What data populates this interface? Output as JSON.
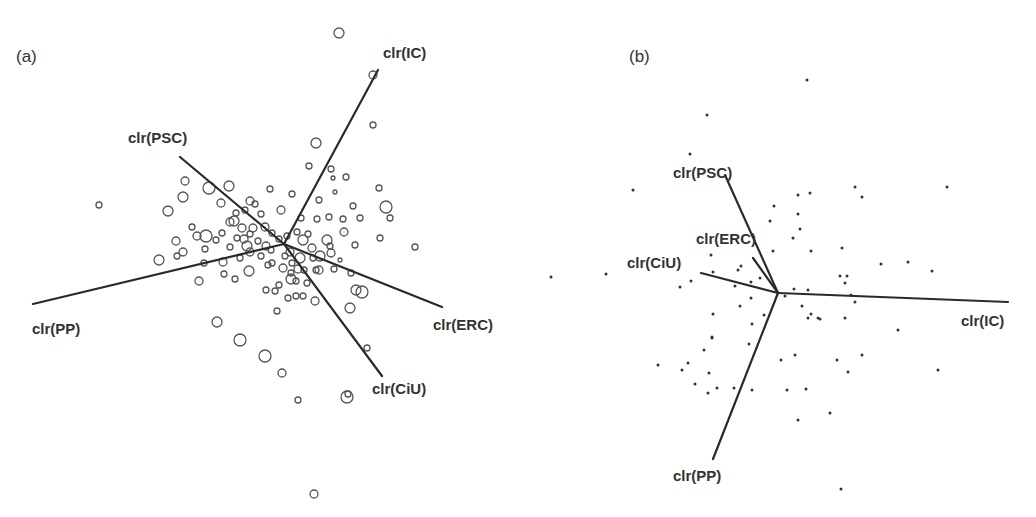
{
  "chart_data": [
    {
      "type": "scatter",
      "title": "(a)",
      "subtype": "compositional biplot",
      "center": [
        284,
        244
      ],
      "marker": "open-circle",
      "rays": [
        {
          "label": "clr(IC)",
          "end": [
            378,
            70
          ],
          "label_pos": [
            383,
            58
          ]
        },
        {
          "label": "clr(PSC)",
          "end": [
            180,
            157
          ],
          "label_pos": [
            128,
            143
          ]
        },
        {
          "label": "clr(PP)",
          "end": [
            33,
            304
          ],
          "label_pos": [
            32,
            334
          ]
        },
        {
          "label": "clr(ERC)",
          "end": [
            442,
            307
          ],
          "label_pos": [
            433,
            330
          ]
        },
        {
          "label": "clr(CiU)",
          "end": [
            382,
            376
          ],
          "label_pos": [
            372,
            394
          ]
        }
      ],
      "points": [
        [
          339,
          33,
          5
        ],
        [
          373,
          75,
          4
        ],
        [
          373,
          125,
          3
        ],
        [
          316,
          143,
          5
        ],
        [
          309,
          166,
          3
        ],
        [
          331,
          169,
          3
        ],
        [
          333,
          178,
          2
        ],
        [
          346,
          177,
          3
        ],
        [
          99,
          205,
          3
        ],
        [
          185,
          181,
          4
        ],
        [
          209,
          188,
          6
        ],
        [
          229,
          186,
          5
        ],
        [
          183,
          197,
          5
        ],
        [
          168,
          211,
          5
        ],
        [
          221,
          203,
          4
        ],
        [
          250,
          201,
          4
        ],
        [
          270,
          189,
          3
        ],
        [
          292,
          194,
          3
        ],
        [
          319,
          200,
          3
        ],
        [
          335,
          192,
          2
        ],
        [
          353,
          206,
          3
        ],
        [
          379,
          188,
          3
        ],
        [
          386,
          207,
          6
        ],
        [
          390,
          218,
          3
        ],
        [
          245,
          210,
          3
        ],
        [
          234,
          221,
          5
        ],
        [
          242,
          228,
          4
        ],
        [
          261,
          214,
          3
        ],
        [
          265,
          227,
          4
        ],
        [
          281,
          210,
          4
        ],
        [
          301,
          218,
          3
        ],
        [
          297,
          232,
          3
        ],
        [
          303,
          240,
          5
        ],
        [
          317,
          219,
          3
        ],
        [
          329,
          217,
          3
        ],
        [
          343,
          219,
          3
        ],
        [
          360,
          218,
          3
        ],
        [
          344,
          232,
          4
        ],
        [
          327,
          240,
          5
        ],
        [
          320,
          256,
          5
        ],
        [
          176,
          241,
          4
        ],
        [
          197,
          236,
          4
        ],
        [
          206,
          236,
          6
        ],
        [
          192,
          227,
          3
        ],
        [
          222,
          233,
          3
        ],
        [
          230,
          222,
          4
        ],
        [
          250,
          234,
          3
        ],
        [
          272,
          233,
          3
        ],
        [
          266,
          246,
          4
        ],
        [
          247,
          246,
          5
        ],
        [
          253,
          228,
          4
        ],
        [
          237,
          238,
          3
        ],
        [
          230,
          247,
          3
        ],
        [
          216,
          240,
          3
        ],
        [
          205,
          249,
          3
        ],
        [
          183,
          252,
          4
        ],
        [
          159,
          260,
          5
        ],
        [
          177,
          256,
          3
        ],
        [
          204,
          263,
          3
        ],
        [
          223,
          262,
          4
        ],
        [
          240,
          258,
          3
        ],
        [
          261,
          256,
          3
        ],
        [
          272,
          263,
          3
        ],
        [
          290,
          252,
          4
        ],
        [
          300,
          258,
          5
        ],
        [
          312,
          248,
          4
        ],
        [
          313,
          258,
          3
        ],
        [
          331,
          253,
          4
        ],
        [
          334,
          269,
          3
        ],
        [
          355,
          245,
          3
        ],
        [
          380,
          238,
          3
        ],
        [
          415,
          247,
          3
        ],
        [
          199,
          281,
          4
        ],
        [
          224,
          274,
          3
        ],
        [
          235,
          279,
          3
        ],
        [
          249,
          271,
          5
        ],
        [
          268,
          265,
          3
        ],
        [
          283,
          268,
          4
        ],
        [
          291,
          273,
          3
        ],
        [
          296,
          281,
          3
        ],
        [
          291,
          279,
          5
        ],
        [
          304,
          270,
          3
        ],
        [
          316,
          270,
          3
        ],
        [
          340,
          260,
          2
        ],
        [
          351,
          273,
          3
        ],
        [
          356,
          290,
          5
        ],
        [
          362,
          292,
          6
        ],
        [
          350,
          308,
          5
        ],
        [
          275,
          291,
          3
        ],
        [
          288,
          298,
          3
        ],
        [
          296,
          296,
          3
        ],
        [
          303,
          296,
          3
        ],
        [
          315,
          301,
          4
        ],
        [
          277,
          311,
          3
        ],
        [
          217,
          322,
          5
        ],
        [
          240,
          340,
          6
        ],
        [
          265,
          356,
          6
        ],
        [
          282,
          373,
          4
        ],
        [
          298,
          400,
          3
        ],
        [
          347,
          397,
          6
        ],
        [
          348,
          394,
          3
        ],
        [
          367,
          348,
          3
        ],
        [
          314,
          494,
          4
        ],
        [
          298,
          269,
          4
        ],
        [
          255,
          204,
          3
        ],
        [
          236,
          213,
          3
        ],
        [
          258,
          241,
          3
        ],
        [
          279,
          239,
          3
        ],
        [
          287,
          236,
          3
        ],
        [
          308,
          234,
          3
        ],
        [
          271,
          250,
          3
        ],
        [
          250,
          252,
          4
        ],
        [
          285,
          256,
          3
        ],
        [
          292,
          263,
          3
        ],
        [
          319,
          270,
          4
        ],
        [
          307,
          283,
          3
        ],
        [
          279,
          285,
          3
        ],
        [
          266,
          290,
          3
        ],
        [
          244,
          239,
          4
        ],
        [
          330,
          246,
          3
        ]
      ]
    },
    {
      "type": "scatter",
      "title": "(b)",
      "subtype": "compositional biplot",
      "center": [
        778,
        293
      ],
      "marker": "filled-dot",
      "rays": [
        {
          "label": "clr(PSC)",
          "end": [
            725,
            175
          ],
          "label_pos": [
            673,
            178
          ]
        },
        {
          "label": "clr(ERC)",
          "end": [
            753,
            258
          ],
          "label_pos": [
            696,
            244
          ]
        },
        {
          "label": "clr(CiU)",
          "end": [
            701,
            273
          ],
          "label_pos": [
            627,
            268
          ]
        },
        {
          "label": "clr(IC)",
          "end": [
            1008,
            302
          ],
          "label_pos": [
            961,
            326
          ]
        },
        {
          "label": "clr(PP)",
          "end": [
            713,
            459
          ],
          "label_pos": [
            673,
            481
          ]
        }
      ],
      "points": [
        [
          807,
          80
        ],
        [
          707,
          115
        ],
        [
          690,
          154
        ],
        [
          633,
          190
        ],
        [
          798,
          195
        ],
        [
          810,
          193
        ],
        [
          774,
          206
        ],
        [
          798,
          214
        ],
        [
          855,
          187
        ],
        [
          862,
          197
        ],
        [
          947,
          187
        ],
        [
          770,
          221
        ],
        [
          793,
          238
        ],
        [
          800,
          229
        ],
        [
          773,
          251
        ],
        [
          811,
          251
        ],
        [
          842,
          248
        ],
        [
          847,
          276
        ],
        [
          908,
          262
        ],
        [
          881,
          264
        ],
        [
          932,
          271
        ],
        [
          711,
          255
        ],
        [
          741,
          266
        ],
        [
          713,
          272
        ],
        [
          738,
          270
        ],
        [
          691,
          281
        ],
        [
          680,
          287
        ],
        [
          735,
          286
        ],
        [
          751,
          282
        ],
        [
          760,
          278
        ],
        [
          785,
          296
        ],
        [
          794,
          289
        ],
        [
          808,
          290
        ],
        [
          840,
          276
        ],
        [
          845,
          283
        ],
        [
          851,
          295
        ],
        [
          855,
          302
        ],
        [
          551,
          277
        ],
        [
          606,
          274
        ],
        [
          713,
          314
        ],
        [
          751,
          298
        ],
        [
          740,
          306
        ],
        [
          802,
          306
        ],
        [
          818,
          318
        ],
        [
          808,
          318
        ],
        [
          811,
          314
        ],
        [
          845,
          318
        ],
        [
          898,
          330
        ],
        [
          712,
          337
        ],
        [
          752,
          324
        ],
        [
          712,
          338
        ],
        [
          749,
          344
        ],
        [
          704,
          350
        ],
        [
          688,
          363
        ],
        [
          658,
          365
        ],
        [
          682,
          370
        ],
        [
          709,
          373
        ],
        [
          717,
          388
        ],
        [
          695,
          384
        ],
        [
          734,
          388
        ],
        [
          708,
          393
        ],
        [
          752,
          390
        ],
        [
          781,
          360
        ],
        [
          795,
          355
        ],
        [
          837,
          360
        ],
        [
          862,
          355
        ],
        [
          848,
          372
        ],
        [
          938,
          370
        ],
        [
          787,
          390
        ],
        [
          806,
          389
        ],
        [
          798,
          420
        ],
        [
          830,
          413
        ],
        [
          841,
          489
        ],
        [
          764,
          315
        ],
        [
          820,
          319
        ]
      ]
    }
  ],
  "panels": {
    "a": {
      "label": "(a)"
    },
    "b": {
      "label": "(b)"
    }
  }
}
